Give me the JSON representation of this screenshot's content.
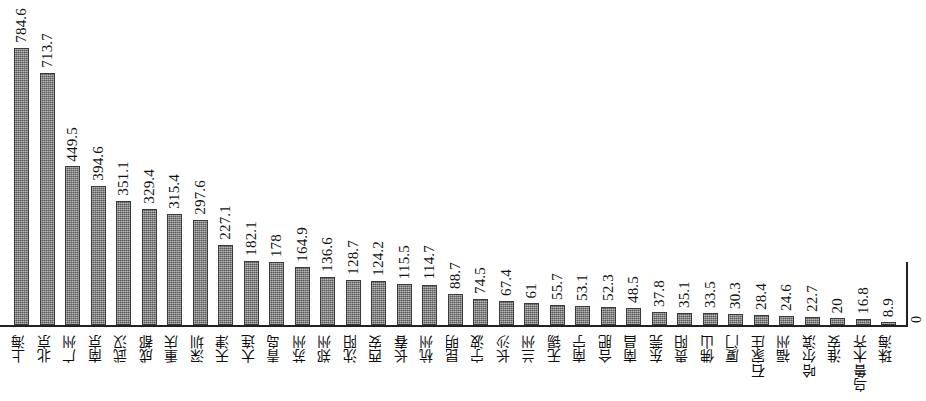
{
  "chart_data": {
    "type": "bar",
    "title": "",
    "subtitle": "",
    "xlabel": "",
    "ylabel": "",
    "ylim": [
      0,
      800
    ],
    "grid": false,
    "legend": null,
    "axis_origin_label": "0",
    "bar_color": "#6f6f6f",
    "categories": [
      "上海",
      "北京",
      "广州",
      "南京",
      "武汉",
      "成都",
      "重庆",
      "深圳",
      "天津",
      "大连",
      "青岛",
      "苏州",
      "郑州",
      "沈阳",
      "西安",
      "长春",
      "杭州",
      "昆明",
      "宁波",
      "长沙",
      "兰州",
      "无锡",
      "南宁",
      "合肥",
      "南昌",
      "东莞",
      "贵阳",
      "佛山",
      "厦门",
      "石家庄",
      "福州",
      "哈尔滨",
      "淮安",
      "乌鲁木齐",
      "珠海"
    ],
    "values": [
      784.6,
      713.7,
      449.5,
      394.6,
      351.1,
      329.4,
      315.4,
      297.6,
      227.1,
      182.1,
      178,
      164.9,
      136.6,
      128.7,
      124.2,
      115.5,
      114.7,
      88.7,
      74.5,
      67.4,
      61,
      55.7,
      53.1,
      52.3,
      48.5,
      37.8,
      35.1,
      33.5,
      30.3,
      28.4,
      24.6,
      22.7,
      20,
      16.8,
      8.9
    ],
    "value_labels": [
      "784.6",
      "713.7",
      "449.5",
      "394.6",
      "351.1",
      "329.4",
      "315.4",
      "297.6",
      "227.1",
      "182.1",
      "178",
      "164.9",
      "136.6",
      "128.7",
      "124.2",
      "115.5",
      "114.7",
      "88.7",
      "74.5",
      "67.4",
      "61",
      "55.7",
      "53.1",
      "52.3",
      "48.5",
      "37.8",
      "35.1",
      "33.5",
      "30.3",
      "28.4",
      "24.6",
      "22.7",
      "20",
      "16.8",
      "8.9"
    ]
  }
}
